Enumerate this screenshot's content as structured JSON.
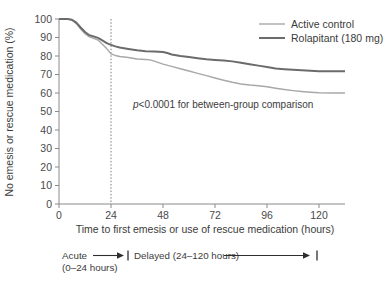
{
  "chart_data": {
    "type": "line",
    "title": "",
    "xlabel": "Time to first emesis or use of rescue medication (hours)",
    "ylabel": "No emesis or rescue medication (%)",
    "xlim": [
      0,
      132
    ],
    "ylim": [
      0,
      100
    ],
    "xticks": [
      0,
      24,
      48,
      72,
      96,
      120
    ],
    "xtick_labels": [
      "0",
      "24",
      "48",
      "72",
      "96",
      "120"
    ],
    "yticks": [
      0,
      10,
      20,
      30,
      40,
      50,
      60,
      70,
      80,
      90,
      100
    ],
    "ytick_labels": [
      "0",
      "10",
      "20",
      "30",
      "40",
      "50",
      "60",
      "70",
      "80",
      "90",
      "100"
    ],
    "grid": false,
    "legend_position": "top-right",
    "annotations": [
      {
        "name": "p-value",
        "text_italic": "p",
        "text": "<0.0001 for between-group comparison",
        "x": 42,
        "y": 51
      },
      {
        "name": "acute-phase",
        "label": "Acute",
        "sublabel": "(0–24 hours)",
        "range": [
          0,
          24
        ]
      },
      {
        "name": "delayed-phase",
        "label": "Delayed (24–120 hours)",
        "range": [
          24,
          120
        ]
      }
    ],
    "reference_line": {
      "name": "24-hour-divider",
      "x": 24,
      "style": "dotted"
    },
    "series": [
      {
        "name": "Active control",
        "color": "#a8a8a8",
        "width": 1.4,
        "points": [
          [
            0,
            100
          ],
          [
            4,
            100
          ],
          [
            6,
            99.4
          ],
          [
            8,
            97.5
          ],
          [
            10,
            94.6
          ],
          [
            12,
            92.0
          ],
          [
            14,
            90.3
          ],
          [
            16,
            89.6
          ],
          [
            18,
            88.6
          ],
          [
            20,
            86.4
          ],
          [
            22,
            84.0
          ],
          [
            24,
            81.2
          ],
          [
            26,
            80.3
          ],
          [
            28,
            79.7
          ],
          [
            32,
            79.2
          ],
          [
            36,
            78.4
          ],
          [
            40,
            78.1
          ],
          [
            42,
            77.9
          ],
          [
            44,
            77.2
          ],
          [
            46,
            76.4
          ],
          [
            48,
            75.6
          ],
          [
            52,
            74.4
          ],
          [
            56,
            73.1
          ],
          [
            60,
            71.9
          ],
          [
            64,
            70.6
          ],
          [
            68,
            69.4
          ],
          [
            72,
            68.1
          ],
          [
            76,
            66.9
          ],
          [
            80,
            65.8
          ],
          [
            84,
            64.9
          ],
          [
            88,
            64.3
          ],
          [
            92,
            63.9
          ],
          [
            96,
            63.4
          ],
          [
            100,
            62.6
          ],
          [
            104,
            61.9
          ],
          [
            108,
            61.3
          ],
          [
            112,
            60.8
          ],
          [
            116,
            60.4
          ],
          [
            120,
            60.1
          ],
          [
            126,
            60.0
          ],
          [
            132,
            60.0
          ]
        ]
      },
      {
        "name": "Rolapitant (180 mg)",
        "color": "#6b6b6b",
        "width": 2.0,
        "points": [
          [
            0,
            100
          ],
          [
            4,
            100
          ],
          [
            6,
            99.6
          ],
          [
            8,
            98.0
          ],
          [
            10,
            95.4
          ],
          [
            12,
            93.0
          ],
          [
            14,
            91.2
          ],
          [
            16,
            90.6
          ],
          [
            18,
            89.8
          ],
          [
            20,
            88.4
          ],
          [
            22,
            87.0
          ],
          [
            24,
            86.0
          ],
          [
            26,
            85.2
          ],
          [
            28,
            84.6
          ],
          [
            32,
            83.8
          ],
          [
            36,
            83.1
          ],
          [
            40,
            82.6
          ],
          [
            44,
            82.4
          ],
          [
            48,
            82.2
          ],
          [
            50,
            81.6
          ],
          [
            52,
            80.8
          ],
          [
            56,
            80.0
          ],
          [
            60,
            79.4
          ],
          [
            64,
            78.8
          ],
          [
            68,
            78.3
          ],
          [
            72,
            77.9
          ],
          [
            76,
            77.6
          ],
          [
            80,
            77.1
          ],
          [
            84,
            76.4
          ],
          [
            88,
            75.6
          ],
          [
            92,
            74.8
          ],
          [
            96,
            74.0
          ],
          [
            100,
            73.3
          ],
          [
            104,
            72.9
          ],
          [
            108,
            72.6
          ],
          [
            112,
            72.3
          ],
          [
            116,
            72.0
          ],
          [
            120,
            71.8
          ],
          [
            126,
            71.7
          ],
          [
            132,
            71.7
          ]
        ]
      }
    ]
  },
  "legend": {
    "items": [
      {
        "label": "Active control",
        "color": "#a8a8a8",
        "width": 1.4
      },
      {
        "label": "Rolapitant (180 mg)",
        "color": "#6b6b6b",
        "width": 2.0
      }
    ]
  }
}
